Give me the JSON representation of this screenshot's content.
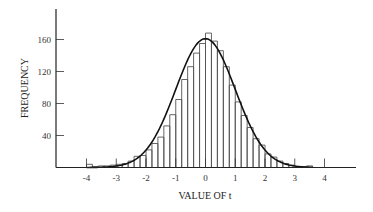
{
  "chart_data": {
    "type": "bar",
    "subtype": "histogram-with-normal-curve",
    "title": "",
    "xlabel": "VALUE OF t",
    "ylabel": "FREQUENCY",
    "xlim": [
      -5,
      5
    ],
    "ylim": [
      0,
      200
    ],
    "x_ticks": [
      -4,
      -3,
      -2,
      -1,
      0,
      1,
      2,
      3,
      4
    ],
    "x_tick_labels": [
      "-4",
      "-3",
      "-2",
      "-1",
      "0",
      "1",
      "2",
      "3",
      "4"
    ],
    "y_ticks": [
      40,
      80,
      120,
      160
    ],
    "y_tick_labels": [
      "40",
      "80",
      "120",
      "160"
    ],
    "grid": false,
    "legend": null,
    "bin_width": 0.2,
    "bin_starts": [
      -4.0,
      -3.8,
      -3.6,
      -3.4,
      -3.2,
      -3.0,
      -2.8,
      -2.6,
      -2.4,
      -2.2,
      -2.0,
      -1.8,
      -1.6,
      -1.4,
      -1.2,
      -1.0,
      -0.8,
      -0.6,
      -0.4,
      -0.2,
      0.0,
      0.2,
      0.4,
      0.6,
      0.8,
      1.0,
      1.2,
      1.4,
      1.6,
      1.8,
      2.0,
      2.2,
      2.4,
      2.6,
      2.8,
      3.0,
      3.2,
      3.4
    ],
    "values": [
      4,
      1,
      2,
      2,
      3,
      4,
      5,
      8,
      14,
      15,
      22,
      30,
      38,
      52,
      66,
      85,
      110,
      126,
      143,
      155,
      168,
      158,
      146,
      126,
      103,
      82,
      65,
      50,
      36,
      28,
      17,
      13,
      8,
      5,
      3,
      1,
      1,
      2
    ],
    "curve": {
      "name": "normal density",
      "mean": 0,
      "sd": 1,
      "peak": 161
    }
  }
}
